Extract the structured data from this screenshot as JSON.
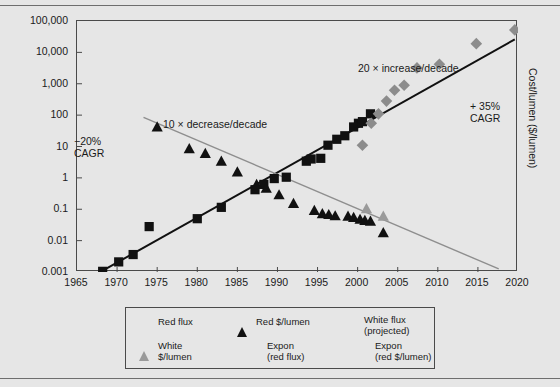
{
  "chart_data": {
    "type": "scatter",
    "title": "",
    "xlabel": "",
    "ylabel": "Light output / package (lumens)",
    "ylabel_right": "Cost/lumen ($/lumen)",
    "xlim": [
      1965,
      2020
    ],
    "ylim": [
      0.001,
      100000
    ],
    "yscale": "log",
    "grid": false,
    "legend_position": "below-plot",
    "xticks": [
      "1965",
      "1970",
      "1975",
      "1980",
      "1985",
      "1990",
      "1995",
      "2000",
      "2005",
      "2010",
      "2015",
      "2020"
    ],
    "xtick_values": [
      1965,
      1970,
      1975,
      1980,
      1985,
      1990,
      1995,
      2000,
      2005,
      2010,
      2015,
      2020
    ],
    "yticks": [
      "100,000",
      "10,000",
      "1,000",
      "100",
      "10",
      "1",
      "0.1",
      "0.01",
      "0.001"
    ],
    "ytick_values": [
      100000,
      10000,
      1000,
      100,
      10,
      1,
      0.1,
      0.01,
      0.001
    ],
    "annotations": [
      {
        "text": "10 × decrease/decade",
        "x": 1976.5,
        "y": 30
      },
      {
        "text": "−20%\nCAGR",
        "x": 1966.5,
        "y": 12
      },
      {
        "text": "20 × increase/decade",
        "x": 2001.0,
        "y": 2200
      },
      {
        "text": "+ 35%\nCAGR",
        "x": 2015.5,
        "y": 100
      }
    ],
    "series": [
      {
        "name": "Red flux",
        "marker": "square",
        "color": "#111111",
        "points": [
          [
            1968.2,
            0.00105
          ],
          [
            1970.2,
            0.0021
          ],
          [
            1972.0,
            0.0036
          ],
          [
            1974.0,
            0.028
          ],
          [
            1980.0,
            0.05
          ],
          [
            1983.0,
            0.115
          ],
          [
            1987.2,
            0.42
          ],
          [
            1988.3,
            0.62
          ],
          [
            1989.6,
            0.95
          ],
          [
            1991.1,
            1.05
          ],
          [
            1993.6,
            3.4
          ],
          [
            1994.2,
            4.0
          ],
          [
            1995.4,
            4.2
          ],
          [
            1996.3,
            11.0
          ],
          [
            1997.4,
            17.0
          ],
          [
            1998.4,
            22.0
          ],
          [
            1999.5,
            42.0
          ],
          [
            2000.1,
            55.0
          ],
          [
            2000.6,
            62.0
          ],
          [
            2001.6,
            110.0
          ]
        ]
      },
      {
        "name": "Red $/lumen",
        "marker": "triangle",
        "color": "#111111",
        "points": [
          [
            1975.0,
            42.0
          ],
          [
            1979.0,
            8.5
          ],
          [
            1981.0,
            6.0
          ],
          [
            1983.0,
            3.4
          ],
          [
            1985.0,
            1.55
          ],
          [
            1987.4,
            0.62
          ],
          [
            1988.6,
            0.47
          ],
          [
            1990.2,
            0.29
          ],
          [
            1992.0,
            0.155
          ],
          [
            1994.6,
            0.092
          ],
          [
            1995.6,
            0.073
          ],
          [
            1996.4,
            0.068
          ],
          [
            1997.2,
            0.062
          ],
          [
            1998.8,
            0.06
          ],
          [
            1999.5,
            0.055
          ],
          [
            2000.3,
            0.048
          ],
          [
            2000.9,
            0.044
          ],
          [
            2001.6,
            0.042
          ],
          [
            2003.2,
            0.018
          ]
        ]
      },
      {
        "name": "White $/lumen",
        "marker": "triangle",
        "color": "#9a9a9a",
        "points": [
          [
            2001.1,
            0.105
          ],
          [
            2003.2,
            0.06
          ]
        ]
      },
      {
        "name": "White flux (projected)",
        "marker": "diamond",
        "color": "#8c8c8c",
        "points": [
          [
            2000.6,
            11.0
          ],
          [
            2001.7,
            55.0
          ],
          [
            2002.6,
            110.0
          ],
          [
            2003.6,
            280.0
          ],
          [
            2004.6,
            620.0
          ],
          [
            2005.8,
            900.0
          ],
          [
            2007.4,
            3200.0
          ],
          [
            2010.2,
            4200.0
          ],
          [
            2014.8,
            19000.0
          ],
          [
            2019.6,
            52000.0
          ]
        ]
      },
      {
        "name": "Expon (red flux)",
        "marker": "line",
        "color": "#111111",
        "fit": {
          "x": [
            1967.3,
            2019.6
          ],
          "y": [
            0.00082,
            26000.0
          ]
        }
      },
      {
        "name": "Expon (red $/lumen)",
        "marker": "line",
        "color": "#8e8e8e",
        "fit": {
          "x": [
            1973.3,
            2017.6
          ],
          "y": [
            85.0,
            0.00125
          ]
        }
      }
    ]
  },
  "axes": {
    "ylabel_left": "Light output / package (lumens)",
    "ylabel_right": "Cost/lumen ($/lumen)"
  },
  "annotations": {
    "decrease": "10 × decrease/decade",
    "cagr_negative": "−20%\nCAGR",
    "increase": "20 × increase/decade",
    "cagr_positive": "+ 35%\nCAGR"
  },
  "legend": {
    "items": [
      {
        "label": "Red flux",
        "marker": "square-black"
      },
      {
        "label": "Red $/lumen",
        "marker": "triangle-black"
      },
      {
        "label": "White flux\n(projected)",
        "marker": "diamond-gray"
      },
      {
        "label": "White\n$/lumen",
        "marker": "triangle-gray"
      },
      {
        "label": "Expon\n(red flux)",
        "marker": "line-black"
      },
      {
        "label": "Expon\n(red $/lumen)",
        "marker": "line-gray"
      }
    ]
  },
  "colors": {
    "background": "#e6e6e6",
    "black_series": "#111111",
    "gray_series": "#8c8c8c",
    "gray_line": "#8e8e8e",
    "frame": "#4a4a4a"
  }
}
